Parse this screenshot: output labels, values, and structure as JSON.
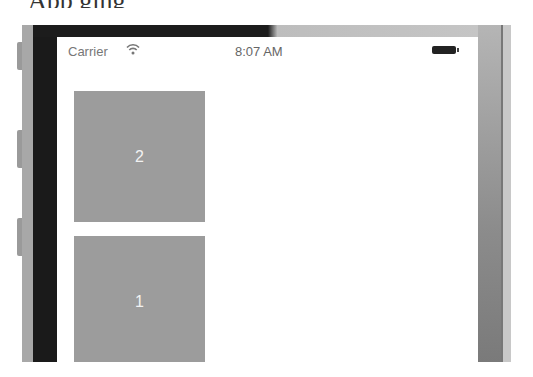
{
  "page_caption_fragment": "App                                   ging",
  "status_bar": {
    "carrier": "Carrier",
    "wifi_icon": "wifi-icon",
    "time": "8:07 AM",
    "battery_icon": "battery-icon"
  },
  "views": [
    {
      "label": "2"
    },
    {
      "label": "1"
    }
  ],
  "colors": {
    "box": "#9c9c9c",
    "box_text": "#f2f2f2",
    "screen_bg": "#ffffff"
  }
}
